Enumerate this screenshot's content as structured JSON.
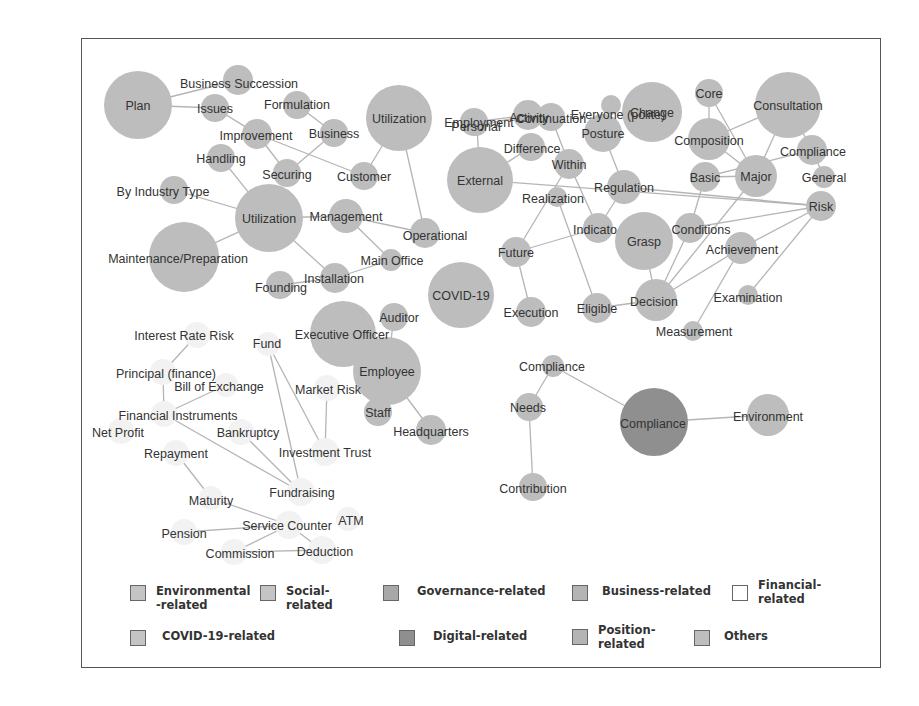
{
  "diagram": {
    "type": "co-occurrence network",
    "colors": {
      "node_default": "#bdbdbd",
      "node_digital": "#8f8f8f",
      "node_financial": "#f2f2f2",
      "edge": "#b5b5b5",
      "text": "#333333"
    },
    "nodes": [
      {
        "id": "plan",
        "label": "Plan",
        "category": "others"
      },
      {
        "id": "business_succession",
        "label": "Business Succession",
        "category": "business"
      },
      {
        "id": "issues",
        "label": "Issues",
        "category": "others"
      },
      {
        "id": "formulation",
        "label": "Formulation",
        "category": "others"
      },
      {
        "id": "improvement",
        "label": "Improvement",
        "category": "others"
      },
      {
        "id": "business",
        "label": "Business",
        "category": "business"
      },
      {
        "id": "utilization1",
        "label": "Utilization",
        "category": "others"
      },
      {
        "id": "handling",
        "label": "Handling",
        "category": "others"
      },
      {
        "id": "securing",
        "label": "Securing",
        "category": "others"
      },
      {
        "id": "customer",
        "label": "Customer",
        "category": "business"
      },
      {
        "id": "by_industry_type",
        "label": "By Industry Type",
        "category": "business"
      },
      {
        "id": "utilization2",
        "label": "Utilization",
        "category": "others"
      },
      {
        "id": "management",
        "label": "Management",
        "category": "governance"
      },
      {
        "id": "operational",
        "label": "Operational",
        "category": "business"
      },
      {
        "id": "maintenance",
        "label": "Maintenance/Preparation",
        "category": "others"
      },
      {
        "id": "main_office",
        "label": "Main Office",
        "category": "position"
      },
      {
        "id": "installation",
        "label": "Installation",
        "category": "others"
      },
      {
        "id": "founding",
        "label": "Founding",
        "category": "business"
      },
      {
        "id": "employment",
        "label": "Employment",
        "category": "social"
      },
      {
        "id": "continuation",
        "label": "Continuation",
        "category": "others"
      },
      {
        "id": "everyone",
        "label": "Everyone (polite)",
        "category": "others"
      },
      {
        "id": "activity",
        "label": "Activity",
        "category": "others"
      },
      {
        "id": "personal",
        "label": "Personal",
        "category": "others"
      },
      {
        "id": "change",
        "label": "Change",
        "category": "others"
      },
      {
        "id": "core",
        "label": "Core",
        "category": "others"
      },
      {
        "id": "consultation",
        "label": "Consultation",
        "category": "others"
      },
      {
        "id": "difference",
        "label": "Difference",
        "category": "others"
      },
      {
        "id": "posture",
        "label": "Posture",
        "category": "others"
      },
      {
        "id": "composition",
        "label": "Composition",
        "category": "governance"
      },
      {
        "id": "compliance1",
        "label": "Compliance",
        "category": "governance"
      },
      {
        "id": "external",
        "label": "External",
        "category": "others"
      },
      {
        "id": "within",
        "label": "Within",
        "category": "others"
      },
      {
        "id": "basic",
        "label": "Basic",
        "category": "others"
      },
      {
        "id": "major",
        "label": "Major",
        "category": "others"
      },
      {
        "id": "general",
        "label": "General",
        "category": "others"
      },
      {
        "id": "regulation",
        "label": "Regulation",
        "category": "governance"
      },
      {
        "id": "realization",
        "label": "Realization",
        "category": "others"
      },
      {
        "id": "risk",
        "label": "Risk",
        "category": "governance"
      },
      {
        "id": "indicator",
        "label": "Indicato",
        "category": "others"
      },
      {
        "id": "grasp",
        "label": "Grasp",
        "category": "others"
      },
      {
        "id": "conditions",
        "label": "Conditions",
        "category": "others"
      },
      {
        "id": "future",
        "label": "Future",
        "category": "others"
      },
      {
        "id": "achievement",
        "label": "Achievement",
        "category": "others"
      },
      {
        "id": "covid19",
        "label": "COVID-19",
        "category": "covid"
      },
      {
        "id": "examination",
        "label": "Examination",
        "category": "others"
      },
      {
        "id": "execution",
        "label": "Execution",
        "category": "others"
      },
      {
        "id": "eligible",
        "label": "Eligible",
        "category": "others"
      },
      {
        "id": "decision",
        "label": "Decision",
        "category": "others"
      },
      {
        "id": "measurement",
        "label": "Measurement",
        "category": "others"
      },
      {
        "id": "auditor",
        "label": "Auditor",
        "category": "position"
      },
      {
        "id": "executive_officer",
        "label": "Executive Officer",
        "category": "position"
      },
      {
        "id": "employee",
        "label": "Employee",
        "category": "position"
      },
      {
        "id": "staff",
        "label": "Staff",
        "category": "position"
      },
      {
        "id": "headquarters",
        "label": "Headquarters",
        "category": "position"
      },
      {
        "id": "interest_rate_risk",
        "label": "Interest Rate Risk",
        "category": "financial"
      },
      {
        "id": "fund",
        "label": "Fund",
        "category": "financial"
      },
      {
        "id": "principal",
        "label": "Principal (finance)",
        "category": "financial"
      },
      {
        "id": "bill_of_exchange",
        "label": "Bill of Exchange",
        "category": "financial"
      },
      {
        "id": "market_risk",
        "label": "Market Risk",
        "category": "financial"
      },
      {
        "id": "financial_instruments",
        "label": "Financial Instruments",
        "category": "financial"
      },
      {
        "id": "net_profit",
        "label": "Net Profit",
        "category": "financial"
      },
      {
        "id": "bankruptcy",
        "label": "Bankruptcy",
        "category": "financial"
      },
      {
        "id": "investment_trust",
        "label": "Investment Trust",
        "category": "financial"
      },
      {
        "id": "repayment",
        "label": "Repayment",
        "category": "financial"
      },
      {
        "id": "fundraising",
        "label": "Fundraising",
        "category": "financial"
      },
      {
        "id": "maturity",
        "label": "Maturity",
        "category": "financial"
      },
      {
        "id": "service_counter",
        "label": "Service Counter",
        "category": "financial"
      },
      {
        "id": "atm",
        "label": "ATM",
        "category": "financial"
      },
      {
        "id": "pension",
        "label": "Pension",
        "category": "financial"
      },
      {
        "id": "commission",
        "label": "Commission",
        "category": "financial"
      },
      {
        "id": "deduction",
        "label": "Deduction",
        "category": "financial"
      },
      {
        "id": "compliance2",
        "label": "Compliance",
        "category": "governance"
      },
      {
        "id": "needs",
        "label": "Needs",
        "category": "others"
      },
      {
        "id": "compliance3",
        "label": "Compliance",
        "category": "digital"
      },
      {
        "id": "environment",
        "label": "Environment",
        "category": "environmental"
      },
      {
        "id": "contribution",
        "label": "Contribution",
        "category": "social"
      }
    ],
    "edges": [
      [
        "plan",
        "business_succession"
      ],
      [
        "plan",
        "issues"
      ],
      [
        "issues",
        "improvement"
      ],
      [
        "improvement",
        "securing"
      ],
      [
        "improvement",
        "customer"
      ],
      [
        "formulation",
        "business"
      ],
      [
        "business",
        "securing"
      ],
      [
        "utilization1",
        "customer"
      ],
      [
        "utilization1",
        "operational"
      ],
      [
        "handling",
        "utilization2"
      ],
      [
        "by_industry_type",
        "utilization2"
      ],
      [
        "utilization2",
        "maintenance"
      ],
      [
        "utilization2",
        "management"
      ],
      [
        "utilization2",
        "installation"
      ],
      [
        "management",
        "operational"
      ],
      [
        "management",
        "main_office"
      ],
      [
        "installation",
        "main_office"
      ],
      [
        "installation",
        "founding"
      ],
      [
        "employment",
        "activity"
      ],
      [
        "personal",
        "activity"
      ],
      [
        "personal",
        "external"
      ],
      [
        "difference",
        "external"
      ],
      [
        "external",
        "risk"
      ],
      [
        "continuation",
        "within"
      ],
      [
        "within",
        "indicator"
      ],
      [
        "within",
        "future"
      ],
      [
        "realization",
        "eligible"
      ],
      [
        "posture",
        "regulation"
      ],
      [
        "regulation",
        "indicator"
      ],
      [
        "indicator",
        "future"
      ],
      [
        "future",
        "execution"
      ],
      [
        "grasp",
        "decision"
      ],
      [
        "eligible",
        "decision"
      ],
      [
        "decision",
        "achievement"
      ],
      [
        "decision",
        "conditions"
      ],
      [
        "conditions",
        "basic"
      ],
      [
        "conditions",
        "risk"
      ],
      [
        "decision",
        "major"
      ],
      [
        "achievement",
        "risk"
      ],
      [
        "achievement",
        "measurement"
      ],
      [
        "examination",
        "risk"
      ],
      [
        "core",
        "composition"
      ],
      [
        "core",
        "major"
      ],
      [
        "composition",
        "consultation"
      ],
      [
        "composition",
        "major"
      ],
      [
        "basic",
        "compliance1"
      ],
      [
        "basic",
        "major"
      ],
      [
        "major",
        "consultation"
      ],
      [
        "consultation",
        "compliance1"
      ],
      [
        "compliance1",
        "general"
      ],
      [
        "regulation",
        "risk"
      ],
      [
        "executive_officer",
        "staff"
      ],
      [
        "auditor",
        "employee"
      ],
      [
        "employee",
        "headquarters"
      ],
      [
        "interest_rate_risk",
        "principal"
      ],
      [
        "principal",
        "financial_instruments"
      ],
      [
        "bill_of_exchange",
        "financial_instruments"
      ],
      [
        "financial_instruments",
        "fundraising"
      ],
      [
        "fund",
        "investment_trust"
      ],
      [
        "fund",
        "fundraising"
      ],
      [
        "market_risk",
        "investment_trust"
      ],
      [
        "bankruptcy",
        "fundraising"
      ],
      [
        "repayment",
        "maturity"
      ],
      [
        "maturity",
        "service_counter"
      ],
      [
        "pension",
        "service_counter"
      ],
      [
        "service_counter",
        "commission"
      ],
      [
        "service_counter",
        "deduction"
      ],
      [
        "commission",
        "deduction"
      ],
      [
        "compliance2",
        "needs"
      ],
      [
        "compliance2",
        "compliance3"
      ],
      [
        "needs",
        "contribution"
      ],
      [
        "compliance3",
        "environment"
      ]
    ]
  },
  "legend": {
    "items": [
      {
        "label": "Environmental\n-related",
        "category": "environmental",
        "color": "#c4c4c4"
      },
      {
        "label": "Social-\nrelated",
        "category": "social",
        "color": "#c4c4c4"
      },
      {
        "label": "Governance-related",
        "category": "governance",
        "color": "#a8a8a8"
      },
      {
        "label": "Business-related",
        "category": "business",
        "color": "#b4b4b4"
      },
      {
        "label": "Financial-\nrelated",
        "category": "financial",
        "color": "#ffffff"
      },
      {
        "label": "COVID-19-related",
        "category": "covid",
        "color": "#c4c4c4"
      },
      {
        "label": "Digital-related",
        "category": "digital",
        "color": "#8f8f8f"
      },
      {
        "label": "Position-\nrelated",
        "category": "position",
        "color": "#b4b4b4"
      },
      {
        "label": "Others",
        "category": "others",
        "color": "#bdbdbd"
      }
    ]
  }
}
